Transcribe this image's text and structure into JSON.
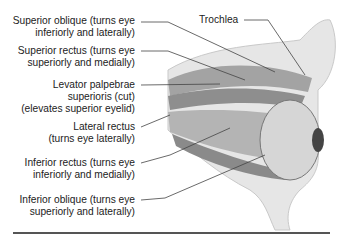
{
  "figure": {
    "labels_left": [
      {
        "line1": "Superior oblique (turns eye",
        "line2": "inferiorly and laterally)",
        "line3": ""
      },
      {
        "line1": "Superior rectus (turns eye",
        "line2": "superiorly and medially)",
        "line3": ""
      },
      {
        "line1": "Levator palpebrae",
        "line2": "superioris (cut)",
        "line3": "(elevates superior eyelid)"
      },
      {
        "line1": "Lateral rectus",
        "line2": "(turns eye laterally)",
        "line3": ""
      },
      {
        "line1": "Inferior rectus (turns eye",
        "line2": "inferiorly and medially)",
        "line3": ""
      },
      {
        "line1": "Inferior oblique (turns eye",
        "line2": "superiorly and laterally)",
        "line3": ""
      }
    ],
    "label_top_right": "Trochlea",
    "colors": {
      "bone": "#e4e4e4",
      "muscle": "#9a9a9a",
      "muscle_dark": "#6f6f6f",
      "eye": "#d8d8d8",
      "text": "#222222",
      "leader": "#444444"
    }
  }
}
